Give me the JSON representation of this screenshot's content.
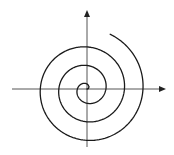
{
  "diagram": {
    "type": "archimedean-spiral",
    "canvas": {
      "width": 174,
      "height": 155
    },
    "colors": {
      "background": "#ffffff",
      "axis": "#555555",
      "spiral": "#1a1a1a"
    },
    "origin": {
      "x": 87,
      "y": 89
    },
    "axes": {
      "x_axis": {
        "x_start": 12,
        "x_end": 166,
        "arrow": "right"
      },
      "y_axis": {
        "y_start": 147,
        "y_end": 10,
        "arrow": "up"
      }
    },
    "spiral": {
      "a_px_per_rad": 2.95,
      "theta_start": -0.125,
      "theta_end": 20.02,
      "direction": "counterclockwise",
      "turns": 3.2
    }
  }
}
